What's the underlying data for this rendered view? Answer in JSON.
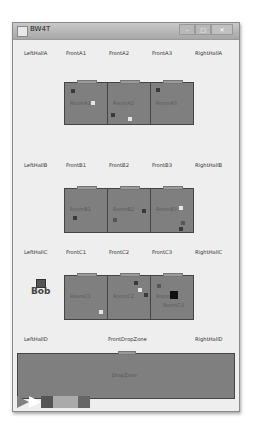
{
  "window": {
    "title": "BW4T",
    "buttons": {
      "minimize": "–",
      "maximize": "□",
      "close": "✕"
    }
  },
  "labels": {
    "row_a": [
      "LeftHallA",
      "FrontA1",
      "FrontA2",
      "FrontA3",
      "RightHallA"
    ],
    "row_b": [
      "LeftHallB",
      "FrontB1",
      "FrontB2",
      "FrontB3",
      "RightHallB"
    ],
    "row_c": [
      "LeftHallC",
      "FrontC1",
      "FrontC2",
      "FrontC3",
      "RightHallC"
    ],
    "row_d": [
      "LeftHallD",
      "FrontDropZone",
      "RightHallD"
    ]
  },
  "rooms": {
    "a": [
      "RoomA1",
      "RoomA2",
      "RoomA3"
    ],
    "b": [
      "RoomB1",
      "RoomB2",
      "RoomB3"
    ],
    "c": [
      "RoomC1",
      "RoomC2",
      "RoomC3"
    ]
  },
  "bot": {
    "name": "Bob",
    "location_label": "RoomC3"
  },
  "dropzone": {
    "label": "DropZone"
  },
  "sequence": {
    "colors": [
      "#808080",
      "#ffffff",
      "#555555",
      "#aaaaaa",
      "#666666"
    ]
  },
  "colors": {
    "room_fill": "#7f7f7f",
    "background": "#eeeeee",
    "block_dark": "#3a3a3a",
    "block_white": "#e6e6e6"
  }
}
